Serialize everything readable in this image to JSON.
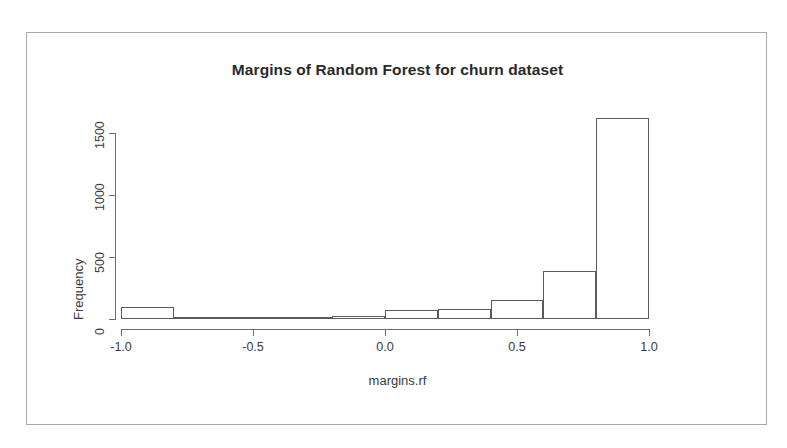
{
  "chart_data": {
    "type": "bar",
    "title": "Margins of Random Forest for churn dataset",
    "xlabel": "margins.rf",
    "ylabel": "Frequency",
    "grid": false,
    "legend": null,
    "xlim": [
      -1.0,
      1.0
    ],
    "ylim": [
      0,
      1700
    ],
    "bin_width": 0.2,
    "x_tick_labels": [
      "-1.0",
      "-0.5",
      "0.0",
      "0.5",
      "1.0"
    ],
    "x_tick_values": [
      -1.0,
      -0.5,
      0.0,
      0.5,
      1.0
    ],
    "y_tick_labels": [
      "0",
      "500",
      "1000",
      "1500"
    ],
    "y_tick_values": [
      0,
      500,
      1000,
      1500
    ],
    "bins": [
      {
        "label": "-1.0 to -0.8",
        "x_left": -1.0,
        "x_right": -0.8,
        "value": 100
      },
      {
        "label": "-0.8 to -0.6",
        "x_left": -0.8,
        "x_right": -0.6,
        "value": 8
      },
      {
        "label": "-0.6 to -0.4",
        "x_left": -0.6,
        "x_right": -0.4,
        "value": 8
      },
      {
        "label": "-0.4 to -0.2",
        "x_left": -0.4,
        "x_right": -0.2,
        "value": 14
      },
      {
        "label": "-0.2 to 0.0",
        "x_left": -0.2,
        "x_right": 0.0,
        "value": 22
      },
      {
        "label": "0.0 to 0.2",
        "x_left": 0.0,
        "x_right": 0.2,
        "value": 70
      },
      {
        "label": "0.2 to 0.4",
        "x_left": 0.2,
        "x_right": 0.4,
        "value": 78
      },
      {
        "label": "0.4 to 0.6",
        "x_left": 0.4,
        "x_right": 0.6,
        "value": 150
      },
      {
        "label": "0.6 to 0.8",
        "x_left": 0.6,
        "x_right": 0.8,
        "value": 390
      },
      {
        "label": "0.8 to 1.0",
        "x_left": 0.8,
        "x_right": 1.0,
        "value": 1620
      }
    ],
    "categories": [
      "-1.0 to -0.8",
      "-0.8 to -0.6",
      "-0.6 to -0.4",
      "-0.4 to -0.2",
      "-0.2 to 0.0",
      "0.0 to 0.2",
      "0.2 to 0.4",
      "0.4 to 0.6",
      "0.6 to 0.8",
      "0.8 to 1.0"
    ],
    "values": [
      100,
      8,
      8,
      14,
      22,
      70,
      78,
      150,
      390,
      1620
    ],
    "colors": {
      "bar_border": "#5a5a5a",
      "bar_fill": "#ffffff",
      "axis": "#6e6e6e",
      "text": "#3a3a3a",
      "title": "#2a2a2a",
      "frame": "#a8a8a8",
      "background": "#ffffff"
    }
  }
}
